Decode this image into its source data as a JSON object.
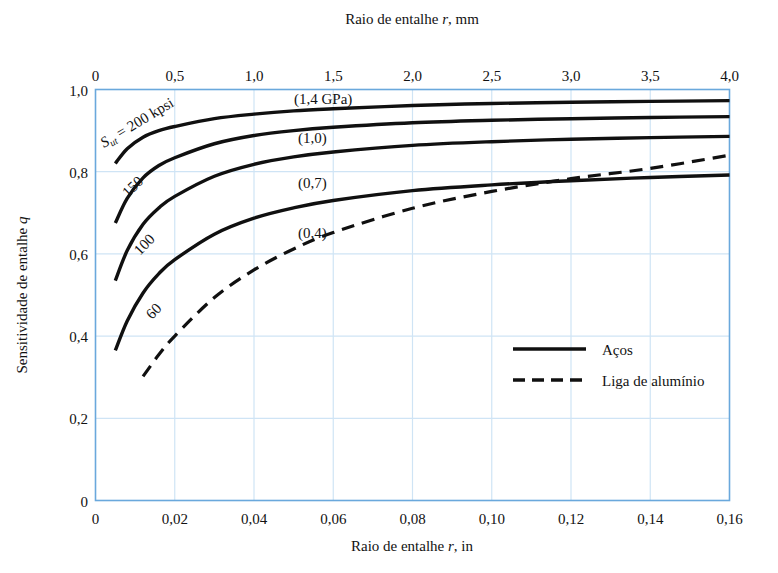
{
  "chart_data": {
    "type": "line",
    "title": "",
    "xlabel": "Raio de entalhe r, in",
    "xlabel_top": "Raio de entalhe r, mm",
    "ylabel": "Sensitividade de entalhe q",
    "xlim": [
      0,
      0.16
    ],
    "xlim_top": [
      0,
      4.0
    ],
    "ylim": [
      0,
      1.0
    ],
    "xticks": [
      "0",
      "0,02",
      "0,04",
      "0,06",
      "0,08",
      "0,10",
      "0,12",
      "0,14",
      "0,16"
    ],
    "xticks_top": [
      "0",
      "0,5",
      "1,0",
      "1,5",
      "2,0",
      "2,5",
      "3,0",
      "3,5",
      "4,0"
    ],
    "yticks": [
      "0",
      "0,2",
      "0,4",
      "0,6",
      "0,8",
      "1,0"
    ],
    "grid": true,
    "legend_position": "lower-right",
    "legend": [
      {
        "label": "Aços",
        "style": "solid"
      },
      {
        "label": "Liga de alumínio",
        "style": "dashed"
      }
    ],
    "series": [
      {
        "name": "Sut = 200 kpsi",
        "left_label": "S_ut = 200 kpsi",
        "right_label": "(1,4 GPa)",
        "style": "solid",
        "material": "steel",
        "x": [
          0.005,
          0.008,
          0.012,
          0.016,
          0.02,
          0.03,
          0.04,
          0.05,
          0.06,
          0.08,
          0.1,
          0.12,
          0.14,
          0.16
        ],
        "y": [
          0.82,
          0.856,
          0.884,
          0.9,
          0.91,
          0.929,
          0.94,
          0.948,
          0.953,
          0.961,
          0.966,
          0.969,
          0.971,
          0.973
        ]
      },
      {
        "name": "Sut = 150 kpsi",
        "left_label": "150",
        "right_label": "(1,0)",
        "style": "solid",
        "material": "steel",
        "x": [
          0.005,
          0.008,
          0.012,
          0.016,
          0.02,
          0.03,
          0.04,
          0.05,
          0.06,
          0.08,
          0.1,
          0.12,
          0.14,
          0.16
        ],
        "y": [
          0.675,
          0.735,
          0.785,
          0.815,
          0.834,
          0.868,
          0.888,
          0.9,
          0.908,
          0.919,
          0.925,
          0.929,
          0.932,
          0.934
        ]
      },
      {
        "name": "Sut = 100 kpsi",
        "left_label": "100",
        "right_label": "(0,7)",
        "style": "solid",
        "material": "steel",
        "x": [
          0.005,
          0.008,
          0.012,
          0.016,
          0.02,
          0.03,
          0.04,
          0.05,
          0.06,
          0.08,
          0.1,
          0.12,
          0.14,
          0.16
        ],
        "y": [
          0.535,
          0.608,
          0.672,
          0.712,
          0.74,
          0.789,
          0.818,
          0.836,
          0.848,
          0.864,
          0.873,
          0.879,
          0.883,
          0.886
        ]
      },
      {
        "name": "Sut = 60 kpsi",
        "left_label": "60",
        "right_label": "(0,4)",
        "style": "solid",
        "material": "steel",
        "x": [
          0.005,
          0.008,
          0.012,
          0.016,
          0.02,
          0.03,
          0.04,
          0.05,
          0.06,
          0.08,
          0.1,
          0.12,
          0.14,
          0.16
        ],
        "y": [
          0.365,
          0.437,
          0.505,
          0.552,
          0.586,
          0.648,
          0.687,
          0.712,
          0.73,
          0.754,
          0.768,
          0.778,
          0.786,
          0.792
        ]
      },
      {
        "name": "Liga de alumínio",
        "left_label": "",
        "right_label": "",
        "style": "dashed",
        "material": "aluminium",
        "x": [
          0.012,
          0.016,
          0.02,
          0.03,
          0.04,
          0.05,
          0.06,
          0.08,
          0.1,
          0.12,
          0.14,
          0.16
        ],
        "y": [
          0.302,
          0.355,
          0.4,
          0.494,
          0.561,
          0.612,
          0.652,
          0.711,
          0.752,
          0.783,
          0.808,
          0.84
        ]
      }
    ]
  },
  "axes": {
    "top_label": "Raio de entalhe r, mm",
    "bottom_label": "Raio de entalhe r, in",
    "left_label": "Sensitividade de entalhe q"
  },
  "annotations": {
    "sut_prefix": "S",
    "sut_sub": "ut",
    "sut_value": "= 200 kpsi",
    "label_150": "150",
    "label_100": "100",
    "label_60": "60",
    "gpa_14": "(1,4 GPa)",
    "gpa_10": "(1,0)",
    "gpa_07": "(0,7)",
    "gpa_04": "(0,4)"
  },
  "colors": {
    "frame": "#6aa8dc",
    "grid": "#cfe4f5",
    "curve": "#101010",
    "background": "#ffffff"
  }
}
